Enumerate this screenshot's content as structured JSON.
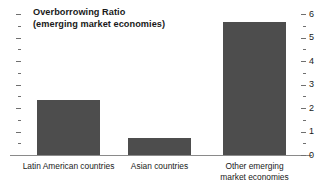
{
  "chart_data": {
    "type": "bar",
    "title": "Overborrowing Ratio",
    "subtitle": "(emerging market economies)",
    "xlabel": "",
    "ylabel": "",
    "categories": [
      "Latin American countries",
      "Asian countries",
      "Other emerging\nmarket economies"
    ],
    "values": [
      2.35,
      0.72,
      5.65
    ],
    "ylim": [
      0,
      6
    ],
    "y_axis_position": "right",
    "y_ticks": [
      0,
      1,
      2,
      3,
      4,
      5,
      6
    ],
    "y_tick_labels": [
      "0",
      "1",
      "2",
      "3",
      "4",
      "5",
      "6"
    ],
    "y_minor_ticks": [
      0.5,
      1.5,
      2.5,
      3.5,
      4.5,
      5.5
    ],
    "grid": false,
    "legend": null,
    "bar_color": "#4d4d4d",
    "axis_color": "#8a8a8a",
    "text_color": "#1a1a1a",
    "background_color": "#ffffff"
  },
  "axis": {
    "labels": [
      "6",
      "5",
      "4",
      "3",
      "2",
      "1",
      "0"
    ]
  }
}
